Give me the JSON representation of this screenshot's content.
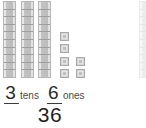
{
  "diagram": {
    "tens_rods": 3,
    "cells_per_rod": 10,
    "ones_cubes": 6,
    "partial_rod_visible": 1,
    "colors": {
      "block_fill": "#cfcfcf",
      "block_border": "#b6b6b6",
      "unit_fill": "#d6d6d6",
      "text": "#2b2b2b",
      "background": "#ffffff"
    }
  },
  "answer": {
    "tens_digit": "3",
    "tens_label": "tens",
    "ones_digit": "6",
    "ones_label": "ones",
    "total": "36"
  },
  "ones_layout": {
    "rows": [
      {
        "count": 1
      },
      {
        "count": 1
      },
      {
        "count": 2
      },
      {
        "count": 2
      }
    ]
  }
}
